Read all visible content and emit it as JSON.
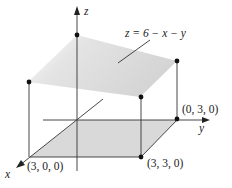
{
  "diagram": {
    "equation": "z = 6 − x − y",
    "axes": {
      "x": "x",
      "y": "y",
      "z": "z"
    },
    "points": [
      {
        "label": "(0, 3, 0)"
      },
      {
        "label": "(3, 3, 0)"
      },
      {
        "label": "(3, 0, 0)"
      }
    ],
    "colors": {
      "plane": "#d8d8d8",
      "base": "#d6d6d6",
      "lines": "#333333"
    }
  }
}
